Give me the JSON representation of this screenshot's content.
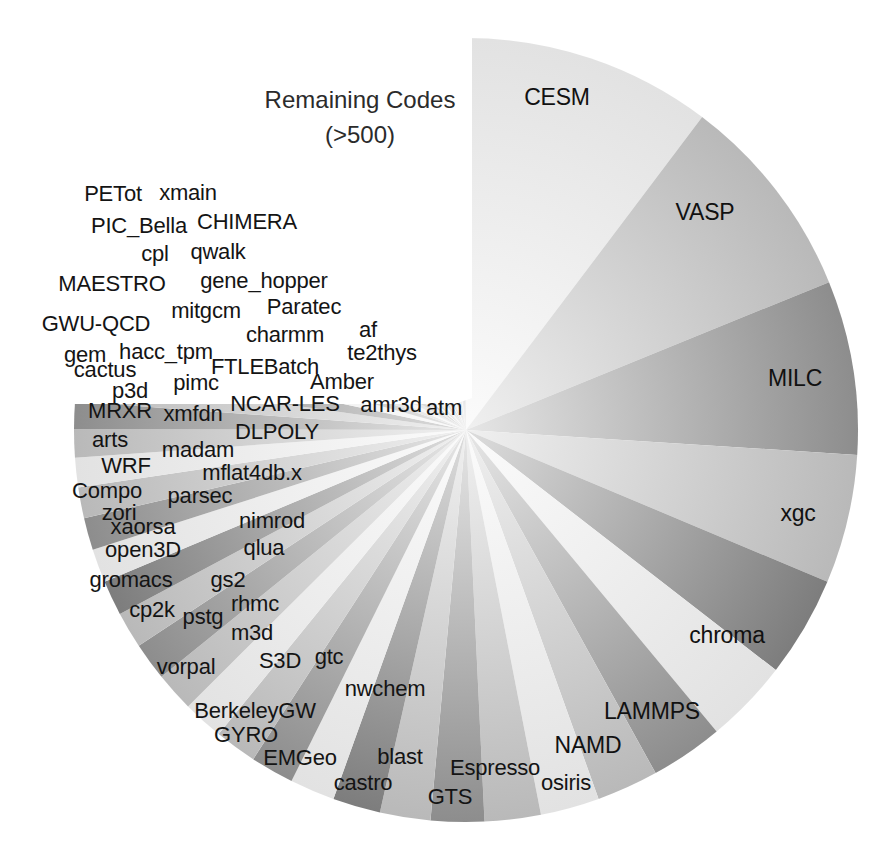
{
  "figure": {
    "background": "#ffffff",
    "annotation": {
      "line1": "Remaining Codes",
      "line2": "(>500)",
      "x": 360,
      "y": 118
    }
  },
  "chart_data": {
    "type": "pie",
    "title": "",
    "subtitle": "",
    "xlabel": "",
    "ylabel": "",
    "legend": "none",
    "grid": false,
    "start_angle_deg": -90,
    "direction": "clockwise",
    "center": [
      466,
      430
    ],
    "radius": 392,
    "note": "Pie of HPC application codes by usage share. Large named wedges on the right; many thin wedges fill the lower-left; the upper-left sector is annotated 'Remaining Codes (>500)'.",
    "annotations": [
      "Remaining Codes",
      "(>500)"
    ],
    "categories": [
      "CESM",
      "VASP",
      "MILC",
      "xgc",
      "chroma",
      "LAMMPS",
      "NAMD",
      "osiris",
      "Espresso",
      "GTS",
      "castro",
      "blast",
      "EMGeo",
      "GYRO",
      "BerkeleyGW",
      "nwchem",
      "gtc",
      "S3D",
      "vorpal",
      "m3d",
      "rhmc",
      "pstg",
      "cp2k",
      "gs2",
      "gromacs",
      "qlua",
      "open3D",
      "nimrod",
      "xaorsa",
      "zori",
      "parsec",
      "Compo",
      "mflat4db.x",
      "WRF",
      "madam",
      "arts",
      "DLPOLY",
      "xmfdn",
      "MRXR",
      "atm",
      "amr3d",
      "NCAR-LES",
      "p3d",
      "pimc",
      "Amber",
      "cactus",
      "FTLEBatch",
      "gem",
      "hacc_tpm",
      "te2thys",
      "GWU-QCD",
      "mitgcm",
      "charmm",
      "af",
      "Paratec",
      "MAESTRO",
      "gene_hopper",
      "cpl",
      "qwalk",
      "PIC_Bella",
      "CHIMERA",
      "PETot",
      "xmain"
    ],
    "values": [
      8.9,
      7.4,
      6.2,
      4.6,
      3.6,
      3.0,
      2.6,
      2.2,
      2.1,
      2.0,
      1.9,
      1.8,
      1.7,
      1.6,
      1.55,
      1.5,
      1.45,
      1.4,
      1.35,
      1.3,
      1.25,
      1.2,
      1.15,
      1.1,
      1.05,
      1.0,
      0.98,
      0.95,
      0.92,
      0.9,
      0.88,
      0.85,
      0.82,
      0.8,
      0.78,
      0.76,
      0.74,
      0.72,
      0.7,
      0.68,
      0.66,
      0.64,
      0.62,
      0.6,
      0.58,
      0.56,
      0.54,
      0.52,
      0.5,
      0.48,
      0.46,
      0.44,
      0.42,
      0.4,
      0.38,
      0.36,
      0.34,
      0.32,
      0.3,
      0.28,
      0.26,
      0.24,
      0.22
    ]
  },
  "slice_labels": [
    {
      "text": "CESM",
      "x": 557,
      "y": 97,
      "size": "major"
    },
    {
      "text": "VASP",
      "x": 705,
      "y": 212,
      "size": "major"
    },
    {
      "text": "MILC",
      "x": 795,
      "y": 378,
      "size": "major"
    },
    {
      "text": "xgc",
      "x": 798,
      "y": 513,
      "size": "major"
    },
    {
      "text": "chroma",
      "x": 727,
      "y": 635,
      "size": "major"
    },
    {
      "text": "LAMMPS",
      "x": 652,
      "y": 711,
      "size": "major"
    },
    {
      "text": "NAMD",
      "x": 588,
      "y": 745,
      "size": "major"
    },
    {
      "text": "osiris",
      "x": 566,
      "y": 783,
      "size": "minor"
    },
    {
      "text": "Espresso",
      "x": 495,
      "y": 768,
      "size": "minor"
    },
    {
      "text": "GTS",
      "x": 450,
      "y": 797,
      "size": "minor"
    },
    {
      "text": "castro",
      "x": 363,
      "y": 783,
      "size": "minor"
    },
    {
      "text": "blast",
      "x": 400,
      "y": 757,
      "size": "minor"
    },
    {
      "text": "EMGeo",
      "x": 300,
      "y": 758,
      "size": "minor"
    },
    {
      "text": "GYRO",
      "x": 246,
      "y": 735,
      "size": "minor"
    },
    {
      "text": "BerkeleyGW",
      "x": 255,
      "y": 711,
      "size": "minor"
    },
    {
      "text": "nwchem",
      "x": 385,
      "y": 689,
      "size": "minor"
    },
    {
      "text": "gtc",
      "x": 329,
      "y": 657,
      "size": "minor"
    },
    {
      "text": "S3D",
      "x": 280,
      "y": 661,
      "size": "minor"
    },
    {
      "text": "vorpal",
      "x": 186,
      "y": 667,
      "size": "minor"
    },
    {
      "text": "m3d",
      "x": 252,
      "y": 633,
      "size": "minor"
    },
    {
      "text": "rhmc",
      "x": 255,
      "y": 604,
      "size": "minor"
    },
    {
      "text": "pstg",
      "x": 203,
      "y": 617,
      "size": "minor"
    },
    {
      "text": "cp2k",
      "x": 152,
      "y": 610,
      "size": "minor"
    },
    {
      "text": "gs2",
      "x": 228,
      "y": 580,
      "size": "minor"
    },
    {
      "text": "gromacs",
      "x": 131,
      "y": 580,
      "size": "minor"
    },
    {
      "text": "qlua",
      "x": 264,
      "y": 548,
      "size": "minor"
    },
    {
      "text": "open3D",
      "x": 143,
      "y": 550,
      "size": "minor"
    },
    {
      "text": "nimrod",
      "x": 272,
      "y": 521,
      "size": "minor"
    },
    {
      "text": "xaorsa",
      "x": 143,
      "y": 527,
      "size": "minor"
    },
    {
      "text": "zori",
      "x": 119,
      "y": 513,
      "size": "minor"
    },
    {
      "text": "parsec",
      "x": 200,
      "y": 496,
      "size": "minor"
    },
    {
      "text": "Compo",
      "x": 107,
      "y": 491,
      "size": "minor"
    },
    {
      "text": "mflat4db.x",
      "x": 252,
      "y": 473,
      "size": "minor"
    },
    {
      "text": "WRF",
      "x": 126,
      "y": 466,
      "size": "minor"
    },
    {
      "text": "madam",
      "x": 198,
      "y": 450,
      "size": "minor"
    },
    {
      "text": "arts",
      "x": 110,
      "y": 440,
      "size": "minor"
    },
    {
      "text": "DLPOLY",
      "x": 277,
      "y": 432,
      "size": "minor"
    },
    {
      "text": "xmfdn",
      "x": 193,
      "y": 414,
      "size": "minor"
    },
    {
      "text": "MRXR",
      "x": 120,
      "y": 411,
      "size": "minor"
    },
    {
      "text": "atm",
      "x": 444,
      "y": 408,
      "size": "minor"
    },
    {
      "text": "amr3d",
      "x": 391,
      "y": 405,
      "size": "minor"
    },
    {
      "text": "NCAR-LES",
      "x": 285,
      "y": 404,
      "size": "minor"
    },
    {
      "text": "p3d",
      "x": 130,
      "y": 391,
      "size": "minor"
    },
    {
      "text": "pimc",
      "x": 196,
      "y": 383,
      "size": "minor"
    },
    {
      "text": "Amber",
      "x": 342,
      "y": 382,
      "size": "minor"
    },
    {
      "text": "cactus",
      "x": 105,
      "y": 370,
      "size": "minor"
    },
    {
      "text": "FTLEBatch",
      "x": 265,
      "y": 367,
      "size": "minor"
    },
    {
      "text": "gem",
      "x": 85,
      "y": 355,
      "size": "minor"
    },
    {
      "text": "hacc_tpm",
      "x": 166,
      "y": 352,
      "size": "minor"
    },
    {
      "text": "te2thys",
      "x": 382,
      "y": 353,
      "size": "minor"
    },
    {
      "text": "GWU-QCD",
      "x": 96,
      "y": 324,
      "size": "minor"
    },
    {
      "text": "mitgcm",
      "x": 206,
      "y": 311,
      "size": "minor"
    },
    {
      "text": "charmm",
      "x": 285,
      "y": 335,
      "size": "minor"
    },
    {
      "text": "af",
      "x": 368,
      "y": 330,
      "size": "minor"
    },
    {
      "text": "Paratec",
      "x": 304,
      "y": 307,
      "size": "minor"
    },
    {
      "text": "MAESTRO",
      "x": 112,
      "y": 284,
      "size": "minor"
    },
    {
      "text": "gene_hopper",
      "x": 264,
      "y": 281,
      "size": "minor"
    },
    {
      "text": "cpl",
      "x": 155,
      "y": 254,
      "size": "minor"
    },
    {
      "text": "qwalk",
      "x": 218,
      "y": 252,
      "size": "minor"
    },
    {
      "text": "PIC_Bella",
      "x": 139,
      "y": 226,
      "size": "minor"
    },
    {
      "text": "CHIMERA",
      "x": 247,
      "y": 222,
      "size": "minor"
    },
    {
      "text": "PETot",
      "x": 113,
      "y": 194,
      "size": "minor"
    },
    {
      "text": "xmain",
      "x": 188,
      "y": 193,
      "size": "minor"
    }
  ],
  "colors": {
    "background": "#ffffff",
    "text": "#1c1c1c",
    "slice_light": "#f2f2f2",
    "slice_mid": "#bdbdbd",
    "slice_dark": "#8a8a8a"
  }
}
